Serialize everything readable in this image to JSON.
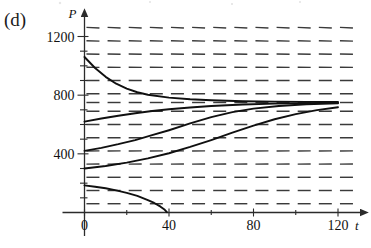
{
  "figure": {
    "panel_label": "(d)",
    "colors": {
      "axis": "#2b2b2b",
      "slope_dash": "#3a3a3a",
      "solution_curve": "#101010",
      "background": "#ffffff"
    }
  },
  "axes": {
    "x": {
      "name": "t",
      "ticks": [
        0,
        20,
        40,
        60,
        80,
        100,
        120
      ],
      "labeled_ticks": [
        "0",
        "40",
        "80",
        "120"
      ],
      "labeled_values": [
        0,
        40,
        80,
        120
      ],
      "range": [
        0,
        128
      ],
      "arrow": true
    },
    "y": {
      "name": "P",
      "ticks": [
        0,
        100,
        200,
        300,
        400,
        500,
        600,
        700,
        800,
        900,
        1000,
        1100,
        1200
      ],
      "labeled_ticks": [
        "400",
        "800",
        "1200"
      ],
      "labeled_values": [
        400,
        800,
        1200
      ],
      "range": [
        0,
        1290
      ],
      "arrow": true
    }
  },
  "chart_data": {
    "type": "line",
    "title": "",
    "xlabel": "t",
    "ylabel": "P",
    "xlim": [
      0,
      128
    ],
    "ylim": [
      0,
      1290
    ],
    "grid": false,
    "legend": "none",
    "annotations": [
      "(d)"
    ],
    "equilibria": [
      {
        "value": 750,
        "kind": "stable"
      },
      {
        "value": 250,
        "kind": "unstable-threshold"
      }
    ],
    "slope_field": {
      "t_values": [
        4,
        14,
        24,
        34,
        44,
        54,
        64,
        74,
        84,
        94,
        104,
        114,
        124
      ],
      "P_values": [
        60,
        150,
        240,
        330,
        420,
        510,
        600,
        690,
        750,
        810,
        900,
        990,
        1080,
        1170,
        1260
      ],
      "model": "dP/dt = k*P*(1 - P/750)*(P/250 - 1)",
      "k": 0.00022,
      "dash_length_px": 13
    },
    "series": [
      {
        "name": "solution-1",
        "initial_P": 1060,
        "points": [
          [
            0,
            1060
          ],
          [
            5,
            985
          ],
          [
            10,
            925
          ],
          [
            15,
            878
          ],
          [
            20,
            845
          ],
          [
            25,
            820
          ],
          [
            30,
            803
          ],
          [
            40,
            783
          ],
          [
            50,
            772
          ],
          [
            60,
            765
          ],
          [
            75,
            759
          ],
          [
            90,
            756
          ],
          [
            105,
            754
          ],
          [
            120,
            753
          ]
        ]
      },
      {
        "name": "solution-2",
        "initial_P": 620,
        "points": [
          [
            0,
            620
          ],
          [
            8,
            641
          ],
          [
            16,
            660
          ],
          [
            24,
            677
          ],
          [
            32,
            692
          ],
          [
            40,
            704
          ],
          [
            50,
            716
          ],
          [
            60,
            726
          ],
          [
            75,
            736
          ],
          [
            90,
            742
          ],
          [
            105,
            746
          ],
          [
            120,
            748
          ]
        ]
      },
      {
        "name": "solution-3",
        "initial_P": 420,
        "points": [
          [
            0,
            420
          ],
          [
            8,
            441
          ],
          [
            16,
            466
          ],
          [
            24,
            494
          ],
          [
            32,
            527
          ],
          [
            40,
            561
          ],
          [
            50,
            607
          ],
          [
            60,
            650
          ],
          [
            70,
            684
          ],
          [
            80,
            708
          ],
          [
            92,
            726
          ],
          [
            105,
            738
          ],
          [
            120,
            745
          ]
        ]
      },
      {
        "name": "solution-4",
        "initial_P": 300,
        "points": [
          [
            0,
            300
          ],
          [
            10,
            317
          ],
          [
            20,
            340
          ],
          [
            30,
            369
          ],
          [
            40,
            404
          ],
          [
            50,
            447
          ],
          [
            60,
            494
          ],
          [
            70,
            544
          ],
          [
            80,
            592
          ],
          [
            90,
            636
          ],
          [
            100,
            671
          ],
          [
            110,
            698
          ],
          [
            120,
            718
          ]
        ]
      },
      {
        "name": "solution-5",
        "initial_P": 185,
        "points": [
          [
            0,
            185
          ],
          [
            5,
            176
          ],
          [
            10,
            165
          ],
          [
            15,
            151
          ],
          [
            20,
            134
          ],
          [
            25,
            113
          ],
          [
            30,
            85
          ],
          [
            33,
            65
          ],
          [
            36,
            40
          ],
          [
            38,
            18
          ],
          [
            39,
            2
          ]
        ]
      }
    ]
  }
}
